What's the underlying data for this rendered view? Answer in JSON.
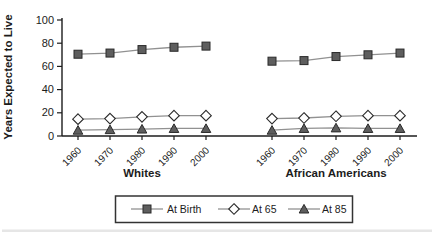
{
  "chart_data": {
    "type": "line",
    "title": "",
    "xlabel": "",
    "ylabel": "Years Expected to Live",
    "ylim": [
      0,
      100
    ],
    "yticks": [
      0,
      20,
      40,
      60,
      80,
      100
    ],
    "grid": false,
    "legend_position": "bottom-boxed",
    "categories": [
      "1960",
      "1970",
      "1980",
      "1990",
      "2000"
    ],
    "groups": [
      {
        "label": "Whites",
        "series": [
          {
            "name": "At Birth",
            "marker": "square",
            "values": [
              70.5,
              71.5,
              74.5,
              76.5,
              77.5
            ]
          },
          {
            "name": "At 65",
            "marker": "diamond",
            "values": [
              14.5,
              15.0,
              16.5,
              17.5,
              17.5
            ]
          },
          {
            "name": "At 85",
            "marker": "triangle",
            "values": [
              5.0,
              5.5,
              6.0,
              6.5,
              6.5
            ]
          }
        ]
      },
      {
        "label": "African Americans",
        "series": [
          {
            "name": "At Birth",
            "marker": "square",
            "values": [
              64.5,
              65.0,
              68.5,
              70.0,
              71.5
            ]
          },
          {
            "name": "At 65",
            "marker": "diamond",
            "values": [
              15.0,
              15.5,
              17.0,
              17.5,
              17.5
            ]
          },
          {
            "name": "At 85",
            "marker": "triangle",
            "values": [
              5.0,
              6.5,
              7.0,
              6.5,
              6.5
            ]
          }
        ]
      }
    ],
    "legend": [
      {
        "name": "At Birth",
        "marker": "square"
      },
      {
        "name": "At 65",
        "marker": "diamond"
      },
      {
        "name": "At 85",
        "marker": "triangle"
      }
    ],
    "colors": {
      "marker_fill": "#5e5e5e",
      "marker_stroke": "#2a2a2a",
      "diamond_fill": "#ffffff",
      "line": "#919191",
      "axis": "#1c1c1c",
      "text": "#1c1c1c",
      "legend_border": "#333333"
    }
  }
}
